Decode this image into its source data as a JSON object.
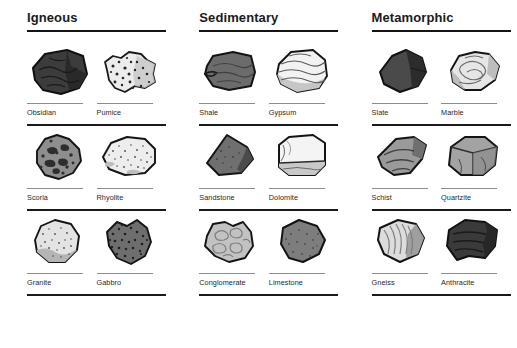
{
  "page": {
    "background_color": "#ffffff",
    "text_color": "#1f1f1f",
    "rule_color": "#1a1a1a",
    "label_rule_color": "#8c8c8c"
  },
  "columns": [
    {
      "id": "igneous",
      "title": "Igneous",
      "rows": [
        {
          "specimens": [
            {
              "name": "Obsidian",
              "shape": "angular-glassy-block",
              "fill": "#3c3c3c",
              "accent": "#272727",
              "texture": "conchoidal-lines"
            },
            {
              "name": "Pumice",
              "shape": "rounded-frothy-lump",
              "fill": "#e8e8e8",
              "accent": "#b8b8b8",
              "texture": "dense-speckle"
            }
          ]
        },
        {
          "specimens": [
            {
              "name": "Scoria",
              "shape": "rounded-vesicular-lump",
              "fill": "#8e8e8e",
              "accent": "#3a3a3a",
              "texture": "large-vesicles"
            },
            {
              "name": "Rhyolite",
              "shape": "oval-smooth-cobble",
              "fill": "#ededed",
              "accent": "#cfcfcf",
              "texture": "fine-speckle"
            }
          ]
        },
        {
          "specimens": [
            {
              "name": "Granite",
              "shape": "rounded-boulder",
              "fill": "#e3e3e3",
              "accent": "#b0b0b0",
              "texture": "fine-speckle"
            },
            {
              "name": "Gabbro",
              "shape": "blocky-chunk",
              "fill": "#6e6e6e",
              "accent": "#2e2e2e",
              "texture": "dense-speckle"
            }
          ]
        }
      ]
    },
    {
      "id": "sedimentary",
      "title": "Sedimentary",
      "rows": [
        {
          "specimens": [
            {
              "name": "Shale",
              "shape": "flat-slab",
              "fill": "#6b6b6b",
              "accent": "#3a3a3a",
              "texture": "bedding-lines"
            },
            {
              "name": "Gypsum",
              "shape": "rounded-tabular",
              "fill": "#f2f2f2",
              "accent": "#a9a9a9",
              "texture": "wavy-bands"
            }
          ]
        },
        {
          "specimens": [
            {
              "name": "Sandstone",
              "shape": "wedge-block",
              "fill": "#6f6f6f",
              "accent": "#3a3a3a",
              "texture": "plain"
            },
            {
              "name": "Dolomite",
              "shape": "rectangular-block",
              "fill": "#f4f4f4",
              "accent": "#bdbdbd",
              "texture": "horizontal-band"
            }
          ]
        },
        {
          "specimens": [
            {
              "name": "Conglomerate",
              "shape": "lumpy-rounded",
              "fill": "#c2c2c2",
              "accent": "#8a8a8a",
              "texture": "pebble-outlines"
            },
            {
              "name": "Limestone",
              "shape": "rounded-triangular",
              "fill": "#7d7d7d",
              "accent": "#4a4a4a",
              "texture": "fine-speckle"
            }
          ]
        }
      ]
    },
    {
      "id": "metamorphic",
      "title": "Metamorphic",
      "rows": [
        {
          "specimens": [
            {
              "name": "Slate",
              "shape": "angular-flat-plate",
              "fill": "#4a4a4a",
              "accent": "#2b2b2b",
              "texture": "cleavage-facet"
            },
            {
              "name": "Marble",
              "shape": "rounded-irregular",
              "fill": "#e6e6e6",
              "accent": "#a8a8a8",
              "texture": "swirl-veins"
            }
          ]
        },
        {
          "specimens": [
            {
              "name": "Schist",
              "shape": "foliated-wedge",
              "fill": "#9a9a9a",
              "accent": "#3f3f3f",
              "texture": "foliation-lines"
            },
            {
              "name": "Quartzite",
              "shape": "faceted-block",
              "fill": "#a3a3a3",
              "accent": "#404040",
              "texture": "facets"
            }
          ]
        },
        {
          "specimens": [
            {
              "name": "Gneiss",
              "shape": "banded-block",
              "fill": "#dcdcdc",
              "accent": "#8f8f8f",
              "texture": "banding-lines"
            },
            {
              "name": "Anthracite",
              "shape": "layered-block",
              "fill": "#3a3a3a",
              "accent": "#1c1c1c",
              "texture": "layer-lines"
            }
          ]
        }
      ]
    }
  ]
}
